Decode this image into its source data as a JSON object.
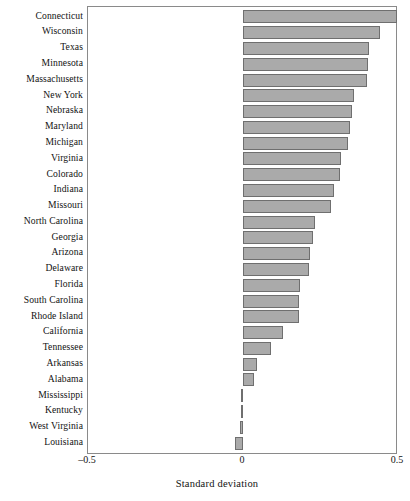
{
  "chart_data": {
    "type": "bar",
    "orientation": "horizontal",
    "title": "",
    "subtitle": "",
    "xlabel": "Standard deviation",
    "ylabel": "",
    "xlim": [
      -0.5,
      0.5
    ],
    "xticks": [
      -0.5,
      0,
      0.5
    ],
    "xtick_labels": [
      "–0.5",
      "0",
      "0.5"
    ],
    "grid": false,
    "legend": null,
    "bar_color": "#aaaaaa",
    "bar_edge_color": "#6f6f6f",
    "categories": [
      "Connecticut",
      "Wisconsin",
      "Texas",
      "Minnesota",
      "Massachusetts",
      "New York",
      "Nebraska",
      "Maryland",
      "Michigan",
      "Virginia",
      "Colorado",
      "Indiana",
      "Missouri",
      "North Carolina",
      "Georgia",
      "Arizona",
      "Delaware",
      "Florida",
      "South Carolina",
      "Rhode Island",
      "California",
      "Tennessee",
      "Arkansas",
      "Alabama",
      "Mississippi",
      "Kentucky",
      "West Virginia",
      "Louisiana"
    ],
    "values": [
      0.497,
      0.443,
      0.406,
      0.403,
      0.4,
      0.358,
      0.352,
      0.345,
      0.338,
      0.315,
      0.313,
      0.294,
      0.284,
      0.232,
      0.226,
      0.216,
      0.213,
      0.184,
      0.181,
      0.181,
      0.129,
      0.09,
      0.045,
      0.035,
      -0.006,
      -0.008,
      -0.01,
      -0.026
    ]
  },
  "axis": {
    "tick_left_label": "–0.5",
    "tick_zero_label": "0",
    "tick_right_label": "0.5",
    "title": "Standard deviation"
  }
}
